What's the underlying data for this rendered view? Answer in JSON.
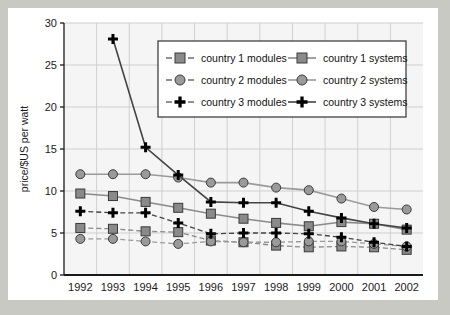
{
  "chart_data": {
    "type": "line",
    "title": "",
    "xlabel": "",
    "ylabel": "price/$US per watt",
    "categories": [
      "1992",
      "1993",
      "1994",
      "1995",
      "1996",
      "1997",
      "1998",
      "1999",
      "2000",
      "2001",
      "2002"
    ],
    "ylim": [
      0,
      30
    ],
    "yticks": [
      0,
      5,
      10,
      15,
      20,
      25,
      30
    ],
    "grid": true,
    "legend_position": "top-center",
    "series": [
      {
        "name": "country 1 modules",
        "style": "dashed",
        "marker": "square",
        "color": "#8a8a8a",
        "values": [
          5.6,
          5.5,
          5.2,
          5.1,
          4.1,
          3.9,
          3.5,
          3.3,
          3.4,
          3.3,
          3.0
        ]
      },
      {
        "name": "country 1 systems",
        "style": "solid",
        "marker": "square",
        "color": "#8a8a8a",
        "values": [
          9.7,
          9.4,
          8.7,
          8.0,
          7.3,
          6.7,
          6.2,
          5.8,
          6.3,
          6.1,
          5.4
        ]
      },
      {
        "name": "country 2 modules",
        "style": "dashed",
        "marker": "circle",
        "color": "#9a9a9a",
        "values": [
          4.3,
          4.3,
          4.0,
          3.7,
          4.0,
          3.9,
          3.9,
          4.0,
          4.0,
          3.7,
          3.4
        ]
      },
      {
        "name": "country 2 systems",
        "style": "solid",
        "marker": "circle",
        "color": "#9a9a9a",
        "values": [
          12.0,
          12.0,
          12.0,
          11.6,
          11.0,
          11.0,
          10.4,
          10.1,
          9.1,
          8.1,
          7.8
        ]
      },
      {
        "name": "country 3 modules",
        "style": "dashed",
        "marker": "plus",
        "color": "#000000",
        "values": [
          7.6,
          7.4,
          7.4,
          6.2,
          4.9,
          5.0,
          5.0,
          4.9,
          4.5,
          3.9,
          3.4
        ]
      },
      {
        "name": "country 3 systems",
        "style": "solid",
        "marker": "plus",
        "color": "#000000",
        "values": [
          null,
          28.1,
          15.2,
          11.9,
          8.7,
          8.6,
          8.6,
          7.6,
          6.8,
          6.1,
          5.6
        ]
      }
    ]
  },
  "legend": {
    "entries": [
      {
        "label": "country 1 modules"
      },
      {
        "label": "country 1 systems"
      },
      {
        "label": "country 2 modules"
      },
      {
        "label": "country 2 systems"
      },
      {
        "label": "country 3 modules"
      },
      {
        "label": "country 3 systems"
      }
    ]
  },
  "colors": {
    "page_background": "#c9c9c4",
    "figure_background": "#ffffff",
    "plot_background": "#f5f5f5",
    "gridline": "#cfcfcf",
    "axis": "#1a1a1a",
    "gray_marker": "#8a8a8a",
    "black_marker": "#000000"
  }
}
